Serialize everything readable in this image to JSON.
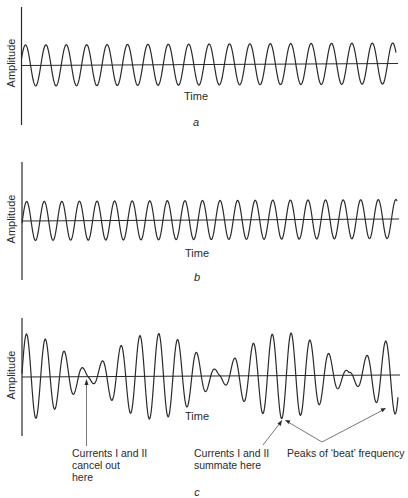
{
  "panels": [
    {
      "id": "a",
      "caption": "a",
      "ylabel": "Amplitude",
      "xlabel": "Time",
      "wave": "single sine",
      "cycles_peaks": 19
    },
    {
      "id": "b",
      "caption": "b",
      "ylabel": "Amplitude",
      "xlabel": "Time",
      "wave": "single sine (slightly higher frequency)",
      "cycles_peaks": 21
    },
    {
      "id": "c",
      "caption": "c",
      "ylabel": "Amplitude",
      "xlabel": "Time",
      "wave": "sum of a and b (beats)"
    }
  ],
  "annotations": {
    "cancel": [
      "Currents I and II",
      "cancel out",
      "here"
    ],
    "summate": [
      "Currents I and II",
      "summate here"
    ],
    "beat": "Peaks of ‘beat’ frequency"
  },
  "colors": {
    "line": "#2a2a2a",
    "arrow": "#555555",
    "background": "#ffffff"
  },
  "chart_data": [
    {
      "type": "line",
      "title": "a",
      "xlabel": "Time",
      "ylabel": "Amplitude",
      "series": [
        {
          "name": "Current I",
          "function": "sine",
          "peaks_visible": 19,
          "amplitude": 1.0
        }
      ],
      "grid": false
    },
    {
      "type": "line",
      "title": "b",
      "xlabel": "Time",
      "ylabel": "Amplitude",
      "series": [
        {
          "name": "Current II",
          "function": "sine",
          "peaks_visible": 21,
          "amplitude": 1.0
        }
      ],
      "grid": false
    },
    {
      "type": "line",
      "title": "c",
      "xlabel": "Time",
      "ylabel": "Amplitude",
      "series": [
        {
          "name": "Current I + Current II",
          "function": "beat (sum of two sines)",
          "envelope_maxima": 4,
          "envelope_minima": 3
        }
      ],
      "annotations": [
        "Currents I and II cancel out here",
        "Currents I and II summate here",
        "Peaks of 'beat' frequency"
      ],
      "grid": false
    }
  ]
}
